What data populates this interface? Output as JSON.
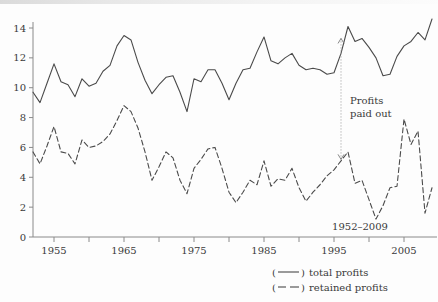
{
  "chart_data": {
    "type": "line",
    "title": "",
    "subtitle": "",
    "xlabel": "",
    "ylabel": "",
    "xlim": [
      1952,
      2009
    ],
    "ylim": [
      0,
      15
    ],
    "grid": false,
    "legend_position": "bottom-right",
    "x_ticks": [
      1955,
      1965,
      1975,
      1985,
      1995,
      2005
    ],
    "x_minor_ticks": [
      1960,
      1970,
      1980,
      1990,
      2000
    ],
    "y_ticks": [
      0,
      2,
      4,
      6,
      8,
      10,
      12,
      14
    ],
    "x": [
      1952,
      1953,
      1954,
      1955,
      1956,
      1957,
      1958,
      1959,
      1960,
      1961,
      1962,
      1963,
      1964,
      1965,
      1966,
      1967,
      1968,
      1969,
      1970,
      1971,
      1972,
      1973,
      1974,
      1975,
      1976,
      1977,
      1978,
      1979,
      1980,
      1981,
      1982,
      1983,
      1984,
      1985,
      1986,
      1987,
      1988,
      1989,
      1990,
      1991,
      1992,
      1993,
      1994,
      1995,
      1996,
      1997,
      1998,
      1999,
      2000,
      2001,
      2002,
      2003,
      2004,
      2005,
      2006,
      2007,
      2008,
      2009
    ],
    "series": [
      {
        "name": "total profits",
        "style": "solid",
        "color": "#4a4a4a",
        "values": [
          9.7,
          9.0,
          10.3,
          11.6,
          10.4,
          10.2,
          9.4,
          10.6,
          10.1,
          10.3,
          11.1,
          11.5,
          12.8,
          13.5,
          13.2,
          11.7,
          10.5,
          9.6,
          10.2,
          10.7,
          10.8,
          9.7,
          8.4,
          10.6,
          10.4,
          11.2,
          11.2,
          10.3,
          9.2,
          10.3,
          11.2,
          11.3,
          12.4,
          13.4,
          11.8,
          11.6,
          12.0,
          12.3,
          11.5,
          11.2,
          11.3,
          11.2,
          10.9,
          11.0,
          12.3,
          14.1,
          13.1,
          13.3,
          12.7,
          12.0,
          10.8,
          10.9,
          12.1,
          12.8,
          13.1,
          13.7,
          13.2,
          14.6
        ]
      },
      {
        "name": "retained profits",
        "style": "dashed",
        "color": "#4a4a4a",
        "values": [
          5.7,
          4.9,
          6.1,
          7.4,
          5.7,
          5.6,
          4.9,
          6.5,
          6.0,
          6.1,
          6.4,
          6.9,
          7.8,
          8.8,
          8.4,
          7.3,
          5.7,
          3.8,
          4.7,
          5.7,
          5.3,
          3.8,
          2.9,
          4.6,
          5.2,
          5.9,
          6.0,
          4.6,
          3.0,
          2.3,
          3.0,
          3.8,
          3.5,
          5.1,
          3.4,
          3.9,
          3.8,
          4.6,
          3.3,
          2.4,
          3.0,
          3.5,
          4.1,
          4.5,
          5.1,
          5.7,
          3.6,
          3.8,
          2.5,
          1.2,
          2.1,
          3.3,
          3.4,
          7.9,
          6.2,
          7.1,
          1.6,
          3.3
        ]
      }
    ],
    "annotation": {
      "text_line1": "Profits",
      "text_line2": "paid out",
      "year": 1996,
      "top_value": 13.3,
      "bottom_value": 5.2
    },
    "period_label": "1952–2009",
    "legend": [
      {
        "marker": "solid",
        "open_paren": "(",
        "close_paren": ")",
        "label": "total profits"
      },
      {
        "marker": "dashed",
        "open_paren": "(",
        "close_paren": ")",
        "label": "retained profits"
      }
    ]
  }
}
